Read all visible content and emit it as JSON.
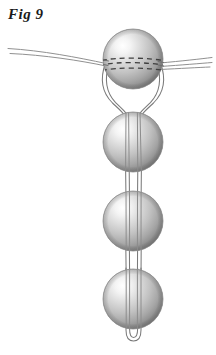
{
  "figure": {
    "caption": "Fig 9",
    "title": "Fig 9",
    "background_color": "#ffffff",
    "width": 216,
    "height": 355
  },
  "colors": {
    "background": "#ffffff",
    "caption_text": "#1a1a1a",
    "thread_stroke": "#6e6e6e",
    "thread_stroke_light": "#9a9a9a",
    "hidden_thread_dash": "#3c3c3c",
    "bead_outline": "#8a8a8a",
    "bead_highlight": "#fbfbfb",
    "bead_midtone": "#c9c9c9",
    "bead_shadow": "#7d7d7d",
    "bead_deep_shadow": "#6a6a6a"
  },
  "beads": [
    {
      "id": "bead-1",
      "label": "top bead",
      "cx": 133,
      "cy": 59,
      "r": 30,
      "hidden_thread_visible": true
    },
    {
      "id": "bead-2",
      "label": "second bead",
      "cx": 133,
      "cy": 142,
      "r": 30,
      "hidden_thread_visible": false
    },
    {
      "id": "bead-3",
      "label": "third bead",
      "cx": 133,
      "cy": 221,
      "r": 30,
      "hidden_thread_visible": false
    },
    {
      "id": "bead-4",
      "label": "bottom bead",
      "cx": 133,
      "cy": 299,
      "r": 30,
      "hidden_thread_visible": false
    }
  ],
  "threads": {
    "horizontal_left_end_x": 8,
    "horizontal_right_end_x": 212,
    "horizontal_y": 64,
    "hidden_dash_rows": 3,
    "bottom_loop_y": 340,
    "strand_count": 4
  },
  "icons": {
    "caption": "figure-label",
    "bead": "sphere-icon",
    "thread": "thread-line-icon",
    "hidden_thread": "dashed-hidden-thread-icon",
    "loop": "u-turn-loop-icon"
  }
}
